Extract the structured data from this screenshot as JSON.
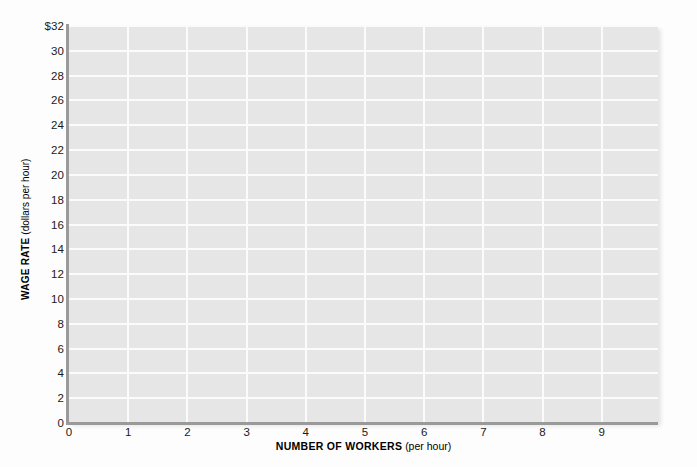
{
  "chart_data": {
    "type": "line",
    "title": "",
    "subtitle": "",
    "xlabel_bold": "NUMBER OF WORKERS",
    "xlabel_paren": "(per hour)",
    "ylabel_bold": "WAGE RATE",
    "ylabel_paren": "(dollars per hour)",
    "xlabel_full": "NUMBER OF WORKERS (per hour)",
    "ylabel_full": "WAGE RATE (dollars per hour)",
    "xlim": [
      0,
      9.95
    ],
    "ylim": [
      0,
      32
    ],
    "x_tick_labels": [
      "0",
      "1",
      "2",
      "3",
      "4",
      "5",
      "6",
      "7",
      "8",
      "9"
    ],
    "x_tick_values": [
      0,
      1,
      2,
      3,
      4,
      5,
      6,
      7,
      8,
      9
    ],
    "y_tick_labels": [
      "$32",
      "30",
      "28",
      "26",
      "24",
      "22",
      "20",
      "18",
      "16",
      "14",
      "12",
      "10",
      "8",
      "6",
      "4",
      "2",
      "0"
    ],
    "y_tick_values": [
      32,
      30,
      28,
      26,
      24,
      22,
      20,
      18,
      16,
      14,
      12,
      10,
      8,
      6,
      4,
      2,
      0
    ],
    "grid": true,
    "grid_color": "#fbfbfb",
    "plot_background": "#e6e6e6",
    "page_background": "#fdfdfd",
    "axis_color": "#9a9a9a",
    "legend": [],
    "series": [],
    "annotations": [],
    "note": "Empty graphing grid for plotting labor demand/supply; no data series drawn."
  },
  "figure": {
    "currency_symbol": "$"
  }
}
